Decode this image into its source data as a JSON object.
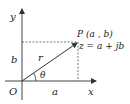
{
  "diagram": {
    "axes": {
      "x_label": "x",
      "y_label": "y",
      "origin_label": "O"
    },
    "point": {
      "label": "P (a , b)",
      "equation": "z = a + jb"
    },
    "vector": {
      "label": "r"
    },
    "angle": {
      "label": "θ"
    },
    "projections": {
      "horizontal_label": "a",
      "vertical_label": "b"
    },
    "colors": {
      "line": "#333333",
      "axis": "#444444",
      "dashed": "#555555",
      "background": "#ffffff"
    }
  }
}
